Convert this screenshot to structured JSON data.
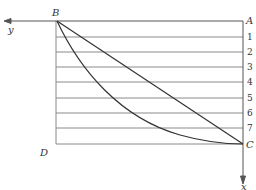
{
  "diagram": {
    "type": "brachistochrone-grid",
    "points": {
      "A": "A",
      "B": "B",
      "C": "C",
      "D": "D"
    },
    "axes": {
      "x": "x",
      "y": "y"
    },
    "row_labels": [
      "1",
      "2",
      "3",
      "4",
      "5",
      "6",
      "7"
    ],
    "colors": {
      "line": "#8a8a8a",
      "curve": "#333333",
      "text": "#333333"
    }
  }
}
